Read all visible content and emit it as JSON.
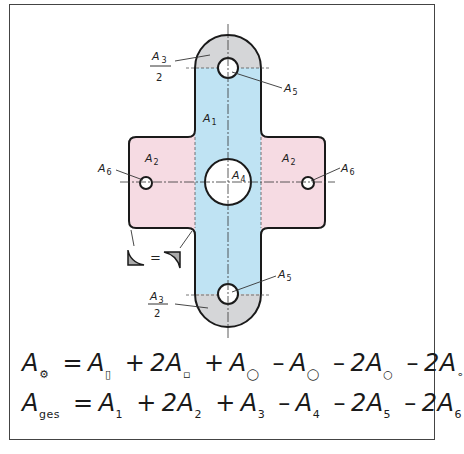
{
  "diagram": {
    "labels": {
      "a1": "A",
      "a1_sub": "1",
      "a2_left": "A",
      "a2_right": "A",
      "a2_sub": "2",
      "a3_top_num": "A",
      "a3_sub": "3",
      "a3_den": "2",
      "a4": "A",
      "a4_sub": "4",
      "a5": "A",
      "a5_sub": "5",
      "a6": "A",
      "a6_sub": "6",
      "equals": "="
    },
    "colors": {
      "strip_blue": "#bfe3f3",
      "wing_pink": "#f6dbe3",
      "cap_gray": "#d5d6d8",
      "outline": "#1a1a1a"
    }
  },
  "formulas": {
    "symbolic": {
      "lhs": "A",
      "lhs_sub": "⚙",
      "terms": [
        {
          "op": "=",
          "coef": "",
          "sym": "A",
          "sub": "▯"
        },
        {
          "op": "+",
          "coef": "2",
          "sym": "A",
          "sub": "▫"
        },
        {
          "op": "+",
          "coef": "",
          "sym": "A",
          "sub": "◯"
        },
        {
          "op": "–",
          "coef": "",
          "sym": "A",
          "sub": "◯"
        },
        {
          "op": "–",
          "coef": "2",
          "sym": "A",
          "sub": "○"
        },
        {
          "op": "–",
          "coef": "2",
          "sym": "A",
          "sub": "∘"
        }
      ]
    },
    "numeric": {
      "lhs": "A",
      "lhs_sub": "ges",
      "terms": [
        {
          "op": "=",
          "coef": "",
          "sym": "A",
          "sub": "1"
        },
        {
          "op": "+",
          "coef": "2",
          "sym": "A",
          "sub": "2"
        },
        {
          "op": "+",
          "coef": "",
          "sym": "A",
          "sub": "3"
        },
        {
          "op": "–",
          "coef": "",
          "sym": "A",
          "sub": "4"
        },
        {
          "op": "–",
          "coef": "2",
          "sym": "A",
          "sub": "5"
        },
        {
          "op": "–",
          "coef": "2",
          "sym": "A",
          "sub": "6"
        }
      ]
    }
  }
}
